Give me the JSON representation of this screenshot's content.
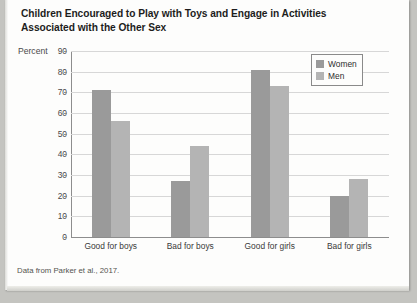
{
  "title": "Children Encouraged to Play with Toys and Engage in Activities Associated with the Other Sex",
  "axis_title": "Percent",
  "source": "Data from Parker et al., 2017.",
  "legend": {
    "women_label": "Women",
    "men_label": "Men"
  },
  "colors": {
    "women": "#9a9a9a",
    "men": "#b4b4b4",
    "grid": "#d7d7d7",
    "axis": "#8d8d8d",
    "page": "#fdfdfc"
  },
  "chart_data": {
    "type": "bar",
    "title": "Children Encouraged to Play with Toys and Engage in Activities Associated with the Other Sex",
    "xlabel": "",
    "ylabel": "Percent",
    "ylim": [
      0,
      90
    ],
    "yticks": [
      0,
      10,
      20,
      30,
      40,
      50,
      60,
      70,
      80,
      90
    ],
    "ytick_labels": [
      "0",
      "10",
      "20",
      "30",
      "40",
      "50",
      "60",
      "70",
      "80",
      "90"
    ],
    "grid": true,
    "legend_position": "top-right",
    "categories": [
      "Good for boys",
      "Bad for boys",
      "Good for girls",
      "Bad for girls"
    ],
    "series": [
      {
        "name": "Women",
        "color": "#9a9a9a",
        "values": [
          71,
          27,
          81,
          20
        ]
      },
      {
        "name": "Men",
        "color": "#b4b4b4",
        "values": [
          56,
          44,
          73,
          28
        ]
      }
    ],
    "source": "Data from Parker et al., 2017."
  }
}
